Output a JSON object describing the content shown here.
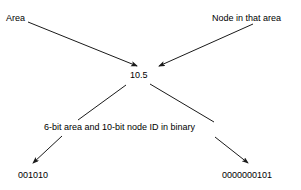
{
  "diagram": {
    "type": "annotated-identifier-breakdown",
    "background_color": "#ffffff",
    "stroke_color": "#1a1a1a",
    "labels": {
      "area": "Area",
      "node_in_that_area": "Node in that area",
      "center_value": "10.5",
      "bit_explanation": "6-bit area and 10-bit node ID in binary",
      "binary_area": "001010",
      "binary_node": "0000000101"
    },
    "connectors": [
      {
        "name": "area-to-center",
        "from_label": "Area",
        "to_label": "10.5",
        "arrowhead": "end",
        "x1": 28,
        "y1": 22,
        "x2": 137,
        "y2": 66
      },
      {
        "name": "node-to-center",
        "from_label": "Node in that area",
        "to_label": "10.5",
        "arrowhead": "end",
        "x1": 253,
        "y1": 24,
        "x2": 159,
        "y2": 66
      },
      {
        "name": "center-to-explanation-left",
        "from_label": "10.5",
        "to_label": "6-bit area and 10-bit node ID in binary",
        "arrowhead": "none",
        "x1": 126,
        "y1": 85,
        "x2": 78,
        "y2": 120
      },
      {
        "name": "center-to-explanation-right",
        "from_label": "10.5",
        "to_label": "6-bit area and 10-bit node ID in binary",
        "arrowhead": "none",
        "x1": 150,
        "y1": 84,
        "x2": 214,
        "y2": 122
      },
      {
        "name": "explanation-to-binary-area",
        "from_label": "6-bit area and 10-bit node ID in binary",
        "to_label": "001010",
        "arrowhead": "end",
        "x1": 62,
        "y1": 136,
        "x2": 33,
        "y2": 163
      },
      {
        "name": "explanation-to-binary-node",
        "from_label": "6-bit area and 10-bit node ID in binary",
        "to_label": "0000000101",
        "arrowhead": "end",
        "x1": 215,
        "y1": 137,
        "x2": 248,
        "y2": 163
      }
    ]
  }
}
